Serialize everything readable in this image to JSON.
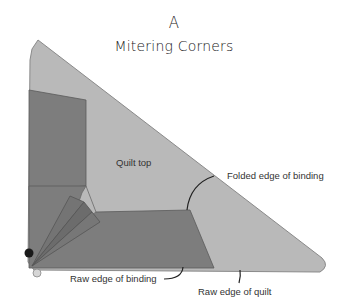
{
  "figure": {
    "letter": "A",
    "title": "Mitering Corners"
  },
  "labels": {
    "quilt_top": "Quilt top",
    "folded_edge": "Folded edge of binding",
    "raw_edge_binding": "Raw edge of binding",
    "raw_edge_quilt": "Raw edge of quilt"
  },
  "colors": {
    "quilt_top": "#b9b9b9",
    "binding": "#7d7d7d",
    "binding_dark": "#6a6a6a",
    "outline": "#5a5a5a",
    "pin_dark": "#1a1a1a",
    "pin_light": "#d6d6d6",
    "leader": "#222222"
  }
}
